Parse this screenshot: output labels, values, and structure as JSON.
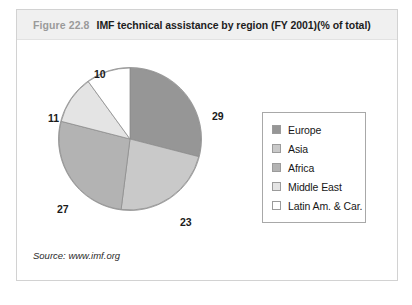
{
  "figure": {
    "number": "Figure 22.8",
    "title": "IMF technical assistance by region (FY 2001)(% of total)",
    "source": "Source: www.imf.org"
  },
  "chart_data": {
    "type": "pie",
    "title": "IMF technical assistance by region (FY 2001)(% of total)",
    "xlabel": "",
    "ylabel": "",
    "unit": "% of total",
    "legend_position": "right",
    "grid": false,
    "start_angle_deg": 0,
    "direction": "clockwise",
    "categories": [
      "Europe",
      "Asia",
      "Africa",
      "Middle East",
      "Latin Am. & Car."
    ],
    "values": [
      29,
      23,
      27,
      11,
      10
    ],
    "colors": [
      "#969696",
      "#c9c9c9",
      "#b3b3b3",
      "#e4e4e4",
      "#ffffff"
    ],
    "slices": [
      {
        "label": "Europe",
        "value": 29,
        "display": "29",
        "color": "#969696"
      },
      {
        "label": "Asia",
        "value": 23,
        "display": "23",
        "color": "#c9c9c9"
      },
      {
        "label": "Africa",
        "value": 27,
        "display": "27",
        "color": "#b3b3b3"
      },
      {
        "label": "Middle East",
        "value": 11,
        "display": "11",
        "color": "#e4e4e4"
      },
      {
        "label": "Latin Am. & Car.",
        "value": 10,
        "display": "10",
        "color": "#ffffff"
      }
    ]
  }
}
